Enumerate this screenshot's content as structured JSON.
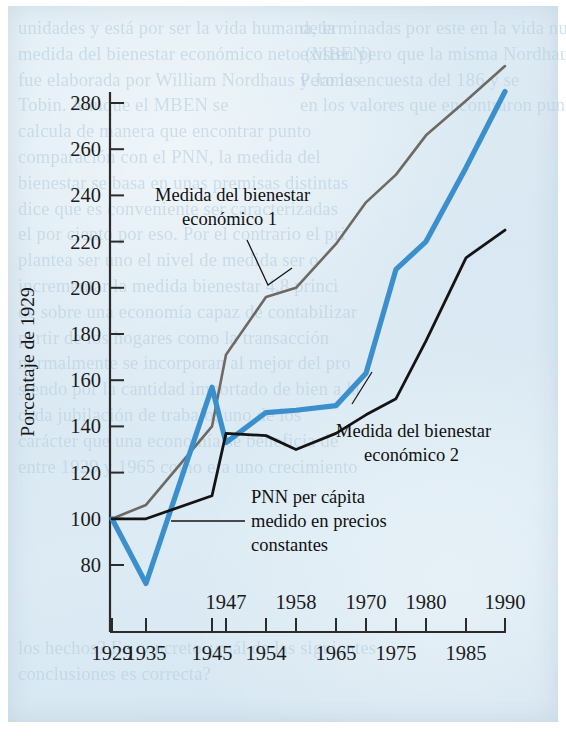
{
  "chart_data": {
    "type": "line",
    "title": "",
    "xlabel": "",
    "ylabel": "Porcentaje de 1929",
    "ylim": [
      70,
      300
    ],
    "xlim": [
      1929,
      1990
    ],
    "grid": false,
    "legend_position": "inline-annotations",
    "y_ticks": [
      80,
      100,
      120,
      140,
      160,
      180,
      200,
      220,
      240,
      260,
      280
    ],
    "x_ticks_upper_row": [
      1947,
      1958,
      1970,
      1980,
      1990
    ],
    "x_ticks_lower_row": [
      1929,
      1935,
      1945,
      1954,
      1965,
      1975,
      1985
    ],
    "x": [
      1929,
      1935,
      1945,
      1947,
      1954,
      1958,
      1965,
      1970,
      1975,
      1980,
      1985,
      1990
    ],
    "series": [
      {
        "name": "Medida del bienestar económico 1",
        "color": "#6c6a63",
        "values": [
          100,
          106,
          140,
          171,
          196,
          200,
          219,
          237,
          249,
          266,
          281,
          296
        ]
      },
      {
        "name": "Medida del bienestar económico 2",
        "color": "#3b8fcd",
        "values": [
          100,
          72,
          157,
          133,
          146,
          147,
          149,
          163,
          208,
          220,
          252,
          285
        ]
      },
      {
        "name": "PNN per cápita medido en precios constantes",
        "color": "#141414",
        "values": [
          100,
          100,
          110,
          137,
          136,
          130,
          137,
          145,
          152,
          177,
          213,
          225
        ]
      }
    ],
    "annotations": [
      {
        "id": "annot-mbe1",
        "lines": [
          "Medida del bienestar",
          "económico 1"
        ],
        "target_series": "Medida del bienestar económico 1"
      },
      {
        "id": "annot-mbe2",
        "lines": [
          "Medida del bienestar",
          "económico 2"
        ],
        "target_series": "Medida del bienestar económico 2"
      },
      {
        "id": "annot-pnn",
        "lines": [
          "PNN per cápita",
          "medido en precios",
          "constantes"
        ],
        "target_series": "PNN per cápita medido en precios constantes"
      }
    ]
  },
  "axis": {
    "y_title": "Porcentaje de 1929",
    "y_tick_labels": [
      "280",
      "260",
      "240",
      "220",
      "200",
      "180",
      "160",
      "140",
      "120",
      "100",
      "80"
    ],
    "x_tick_labels_upper": [
      "1947",
      "1958",
      "1970",
      "1980",
      "1990"
    ],
    "x_tick_labels_lower": [
      "1929",
      "1935",
      "1945",
      "1954",
      "1965",
      "1975",
      "1985"
    ]
  },
  "annotations": {
    "mbe1_line1": "Medida del bienestar",
    "mbe1_line2": "económico 1",
    "mbe2_line1": "Medida del bienestar",
    "mbe2_line2": "económico 2",
    "pnn_line1": "PNN per cápita",
    "pnn_line2": "medido en precios",
    "pnn_line3": "constantes"
  },
  "colors": {
    "series_gray": "#6c6a63",
    "series_blue": "#3b8fcd",
    "series_black": "#141414",
    "paper": "#dce9f2",
    "axis": "#2b2b2b",
    "bleed_text": "#b8cfdf"
  },
  "background_bleed": {
    "left_column": "unidades y está por ser la vida humana, la\nmedida del bienestar económico neto (MBEN)\nfue elaborada por William Nordhaus y James\nTobin. Aunque el MBEN se\ncalcula de manera que encontrar punto\ncomparación con el PNN, la medida del\nbienestar se basa en unas premisas distintas\ndice que es conveniente ser caracterizadas\nel por ciento por eso. Por el contrario el pri\nplantea ser uno el nivel de medida ser o\nincrementar la medida bienestar 4.8 princi\nde sobre una economía capaz de contabilizar\npartir de los hogares como la transacción\nnormalmente se incorporan al mejor del pro\nsiendo por la cantidad importado de bien a la\ncada jubilación de trabajo, uno de los\ncarácter que una economía se beneficia de\nentre 1929 y 1965 como era uno crecimiento",
    "right_column": "determinadas por este en la vida nuestras\nexisten pero que la misma Nordhaus estaban\nPero la encuesta del 186 y se\nen los valores que encontraron punto.",
    "bottom_block": "los hechos? En concreto ¿cuál de las siguientes\nconclusiones es correcta?"
  }
}
